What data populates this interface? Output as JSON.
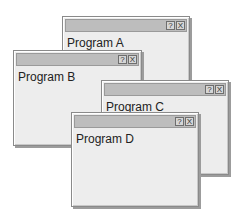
{
  "windows": [
    {
      "id": "a",
      "title": "Program A",
      "buttons": {
        "help": "?",
        "close": "X"
      }
    },
    {
      "id": "b",
      "title": "Program B",
      "buttons": {
        "help": "?",
        "close": "X"
      }
    },
    {
      "id": "c",
      "title": "Program C",
      "buttons": {
        "help": "?",
        "close": "X"
      }
    },
    {
      "id": "d",
      "title": "Program D",
      "buttons": {
        "help": "?",
        "close": "X"
      }
    }
  ],
  "colors": {
    "titlebar": "#bdbdbd",
    "body": "#ededed",
    "border": "#8a8a8a"
  }
}
